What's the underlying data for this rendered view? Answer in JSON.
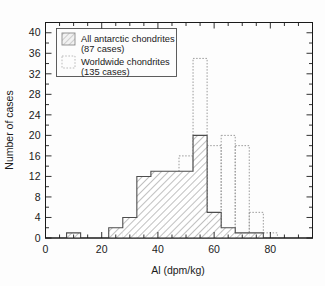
{
  "chart_data": {
    "type": "bar",
    "title": "",
    "subtitle": "",
    "xlabel": "Al (dpm/kg)",
    "ylabel": "Number of cases",
    "xlim": [
      0,
      95
    ],
    "ylim": [
      0,
      42
    ],
    "x_major_ticks": [
      0,
      20,
      40,
      60,
      80
    ],
    "x_major_tick_labels": [
      "0",
      "20",
      "40",
      "60",
      "80"
    ],
    "x_minor_tick_step": 5,
    "y_major_ticks": [
      0,
      4,
      8,
      12,
      16,
      20,
      24,
      28,
      32,
      36,
      40
    ],
    "y_major_tick_labels": [
      "0",
      "4",
      "8",
      "12",
      "16",
      "20",
      "24",
      "28",
      "32",
      "36",
      "40"
    ],
    "y_minor_tick_step": 2,
    "grid": false,
    "bin_width": 5,
    "bin_edges": [
      7.5,
      12.5,
      17.5,
      22.5,
      27.5,
      32.5,
      37.5,
      42.5,
      47.5,
      52.5,
      57.5,
      62.5,
      67.5,
      72.5,
      77.5,
      82.5
    ],
    "series": [
      {
        "name": "All antarctic chondrites",
        "cases": 87,
        "style": "hatched-solid-outline",
        "bins": [
          {
            "x0": 7.5,
            "x1": 12.5,
            "value": 1
          },
          {
            "x0": 22.5,
            "x1": 27.5,
            "value": 2
          },
          {
            "x0": 27.5,
            "x1": 32.5,
            "value": 4
          },
          {
            "x0": 32.5,
            "x1": 37.5,
            "value": 12
          },
          {
            "x0": 37.5,
            "x1": 42.5,
            "value": 13
          },
          {
            "x0": 42.5,
            "x1": 47.5,
            "value": 13
          },
          {
            "x0": 47.5,
            "x1": 52.5,
            "value": 13
          },
          {
            "x0": 52.5,
            "x1": 57.5,
            "value": 20
          },
          {
            "x0": 57.5,
            "x1": 62.5,
            "value": 5
          },
          {
            "x0": 62.5,
            "x1": 67.5,
            "value": 2
          },
          {
            "x0": 67.5,
            "x1": 72.5,
            "value": 1
          },
          {
            "x0": 72.5,
            "x1": 77.5,
            "value": 1
          }
        ]
      },
      {
        "name": "Worldwide chondrites",
        "cases": 135,
        "style": "dotted-outline",
        "bins": [
          {
            "x0": 22.5,
            "x1": 27.5,
            "value": 1
          },
          {
            "x0": 27.5,
            "x1": 32.5,
            "value": 1
          },
          {
            "x0": 32.5,
            "x1": 37.5,
            "value": 1
          },
          {
            "x0": 37.5,
            "x1": 42.5,
            "value": 4
          },
          {
            "x0": 42.5,
            "x1": 47.5,
            "value": 10
          },
          {
            "x0": 47.5,
            "x1": 52.5,
            "value": 16
          },
          {
            "x0": 52.5,
            "x1": 57.5,
            "value": 35
          },
          {
            "x0": 57.5,
            "x1": 62.5,
            "value": 18
          },
          {
            "x0": 62.5,
            "x1": 67.5,
            "value": 20
          },
          {
            "x0": 67.5,
            "x1": 72.5,
            "value": 18
          },
          {
            "x0": 72.5,
            "x1": 77.5,
            "value": 5
          },
          {
            "x0": 77.5,
            "x1": 82.5,
            "value": 1
          }
        ]
      }
    ],
    "legend": {
      "position": "top-left",
      "entries": [
        {
          "label": "All antarctic chondrites",
          "sublabel": "(87 cases)",
          "swatch": "hatched"
        },
        {
          "label": "Worldwide chondrites",
          "sublabel": "(135 cases)",
          "swatch": "dotted"
        }
      ]
    },
    "colors": {
      "axis": "#1a1a1a",
      "series_antarctic_line": "#4d4d4d",
      "series_antarctic_hatch": "#8c8c8c",
      "series_worldwide_line": "#999999",
      "background": "#fdfdfd"
    }
  },
  "axis": {
    "x_title": "Al (dpm/kg)",
    "y_title": "Number of cases",
    "x_labels": [
      "0",
      "20",
      "40",
      "60",
      "80"
    ],
    "y_labels": [
      "0",
      "4",
      "8",
      "12",
      "16",
      "20",
      "24",
      "28",
      "32",
      "36",
      "40"
    ]
  },
  "legend": {
    "entry1_label": "All antarctic chondrites",
    "entry1_sub": "(87 cases)",
    "entry2_label": "Worldwide chondrites",
    "entry2_sub": "(135 cases)"
  }
}
